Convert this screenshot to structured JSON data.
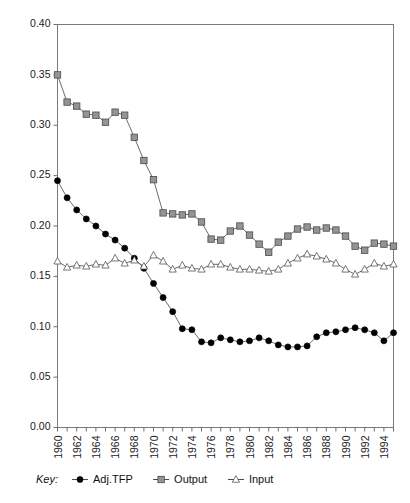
{
  "chart_data": {
    "type": "line",
    "title": "",
    "subtitle": "",
    "xlabel": "",
    "ylabel": "",
    "xlim": [
      1960,
      1995
    ],
    "ylim": [
      0.0,
      0.4
    ],
    "grid": false,
    "legend_position": "bottom",
    "legend_prefix": "Key:",
    "ytick_labels": [
      "0.00",
      "0.05",
      "0.10",
      "0.15",
      "0.20",
      "0.25",
      "0.30",
      "0.35",
      "0.40"
    ],
    "ytick_values": [
      0.0,
      0.05,
      0.1,
      0.15,
      0.2,
      0.25,
      0.3,
      0.35,
      0.4
    ],
    "xtick_labels": [
      "1960",
      "1962",
      "1964",
      "1966",
      "1968",
      "1970",
      "1972",
      "1974",
      "1976",
      "1978",
      "1980",
      "1982",
      "1984",
      "1986",
      "1988",
      "1990",
      "1992",
      "1994"
    ],
    "xtick_values": [
      1960,
      1962,
      1964,
      1966,
      1968,
      1970,
      1972,
      1974,
      1976,
      1978,
      1980,
      1982,
      1984,
      1986,
      1988,
      1990,
      1992,
      1994
    ],
    "x": [
      1960,
      1961,
      1962,
      1963,
      1964,
      1965,
      1966,
      1967,
      1968,
      1969,
      1970,
      1971,
      1972,
      1973,
      1974,
      1975,
      1976,
      1977,
      1978,
      1979,
      1980,
      1981,
      1982,
      1983,
      1984,
      1985,
      1986,
      1987,
      1988,
      1989,
      1990,
      1991,
      1992,
      1993,
      1994,
      1995
    ],
    "series": [
      {
        "name": "Adj.TFP",
        "marker": "circle",
        "color": "#000000",
        "values": [
          0.245,
          0.228,
          0.216,
          0.207,
          0.2,
          0.192,
          0.186,
          0.178,
          0.168,
          0.158,
          0.143,
          0.129,
          0.115,
          0.098,
          0.097,
          0.085,
          0.084,
          0.089,
          0.087,
          0.085,
          0.086,
          0.089,
          0.086,
          0.082,
          0.08,
          0.08,
          0.081,
          0.09,
          0.094,
          0.095,
          0.097,
          0.099,
          0.097,
          0.094,
          0.086,
          0.094
        ]
      },
      {
        "name": "Output",
        "marker": "square",
        "color": "#949494",
        "values": [
          0.35,
          0.323,
          0.319,
          0.311,
          0.31,
          0.303,
          0.313,
          0.31,
          0.288,
          0.265,
          0.246,
          0.213,
          0.212,
          0.211,
          0.212,
          0.204,
          0.187,
          0.186,
          0.195,
          0.2,
          0.191,
          0.182,
          0.174,
          0.184,
          0.19,
          0.197,
          0.199,
          0.196,
          0.198,
          0.196,
          0.19,
          0.18,
          0.176,
          0.183,
          0.182,
          0.18
        ]
      },
      {
        "name": "Input",
        "marker": "triangle",
        "color": "#ffffff",
        "values": [
          0.165,
          0.159,
          0.161,
          0.16,
          0.162,
          0.161,
          0.168,
          0.163,
          0.166,
          0.16,
          0.171,
          0.165,
          0.157,
          0.161,
          0.158,
          0.157,
          0.162,
          0.162,
          0.159,
          0.157,
          0.157,
          0.156,
          0.155,
          0.157,
          0.163,
          0.168,
          0.172,
          0.17,
          0.167,
          0.163,
          0.157,
          0.152,
          0.157,
          0.163,
          0.16,
          0.162
        ]
      }
    ]
  },
  "legend": {
    "prefix": "Key:",
    "entries": [
      {
        "label": "Adj.TFP",
        "marker": "circle"
      },
      {
        "label": "Output",
        "marker": "square"
      },
      {
        "label": "Input",
        "marker": "triangle"
      }
    ]
  }
}
